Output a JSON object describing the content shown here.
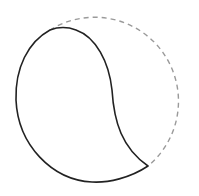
{
  "diagram": {
    "description": "Teardrop/comma shape inside a dashed circle",
    "dashed_circle": {
      "cx": 101,
      "cy": 99,
      "r": 84,
      "color": "#9a9a9a",
      "dash": "5 4"
    },
    "solid_shape": {
      "color": "#222222",
      "stroke_width": 1.6
    },
    "labels": []
  }
}
